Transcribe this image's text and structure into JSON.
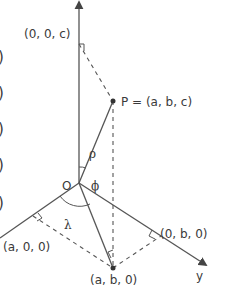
{
  "diagram": {
    "axes": {
      "z": {
        "label": ""
      },
      "y": {
        "label": "y"
      },
      "x": {
        "label": ""
      }
    },
    "labels": {
      "origin": "O",
      "point": "P = (a, b, c)",
      "z_projection": "(0, 0, c)",
      "x_projection": "(a, 0, 0)",
      "y_projection": "(0, b, 0)",
      "xy_projection": "(a, b, 0)",
      "rho": "ρ",
      "phi": "ϕ",
      "lambda": "λ"
    },
    "left_edge_fragments": [
      ")",
      ")",
      ")",
      ")",
      ")"
    ],
    "colors": {
      "line": "#555555",
      "text": "#3a3a3a",
      "background": "#ffffff"
    }
  }
}
